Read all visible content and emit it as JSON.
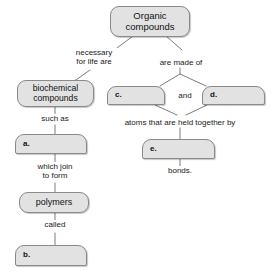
{
  "diagram": {
    "style": {
      "node_fill": "#e2e2e2",
      "node_border": "#8a8a8a",
      "line_color": "#7d7d7d",
      "text_color": "#111111",
      "background": "#ffffff"
    },
    "nodes": [
      {
        "id": "organic",
        "text": "Organic\ncompounds",
        "blank": false,
        "shape": "pill"
      },
      {
        "id": "biochemical",
        "text": "biochemical\ncompounds",
        "blank": false,
        "shape": "pill"
      },
      {
        "id": "c",
        "text": "c.",
        "blank": true,
        "shape": "tab"
      },
      {
        "id": "d",
        "text": "d.",
        "blank": true,
        "shape": "tab"
      },
      {
        "id": "a",
        "text": "a.",
        "blank": true,
        "shape": "tab"
      },
      {
        "id": "e",
        "text": "e.",
        "blank": true,
        "shape": "tab"
      },
      {
        "id": "polymers",
        "text": "polymers",
        "blank": false,
        "shape": "pill"
      },
      {
        "id": "b",
        "text": "b.",
        "blank": true,
        "shape": "tab"
      }
    ],
    "edge_labels": [
      {
        "id": "necessary-for-life-are",
        "text": "necessary\nfor life are"
      },
      {
        "id": "are-made-of",
        "text": "are made of"
      },
      {
        "id": "and",
        "text": "and"
      },
      {
        "id": "such-as",
        "text": "such as"
      },
      {
        "id": "atoms-held-together-by",
        "text": "atoms that are held together by"
      },
      {
        "id": "which-join-to-form",
        "text": "which join\nto form"
      },
      {
        "id": "bonds",
        "text": "bonds."
      },
      {
        "id": "called",
        "text": "called"
      }
    ]
  }
}
